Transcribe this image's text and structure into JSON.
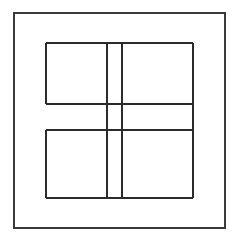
{
  "image": {
    "width": 238,
    "height": 242,
    "background_color": "#ffffff",
    "kind": "line-drawing",
    "title": "",
    "text_labels": []
  },
  "style": {
    "line_color": "#3a3a3a",
    "line_color_dark": "#2b2b2b",
    "outer_frame_width": 1.6,
    "inner_line_width": 1.5
  },
  "figure": {
    "outer_frame": {
      "name": "outer-frame",
      "x1": 14,
      "y1": 13,
      "x2": 225,
      "y2": 228
    },
    "inner_bounds": {
      "x1": 46,
      "y1": 43,
      "x2": 193,
      "y2": 198
    },
    "vertical_lines": [
      {
        "name": "inner-left-edge-upper",
        "x": 46,
        "y1": 43,
        "y2": 104
      },
      {
        "name": "inner-left-edge-lower",
        "x": 46,
        "y1": 130,
        "y2": 198
      },
      {
        "name": "inner-divider-vertical-a",
        "x": 107,
        "y1": 43,
        "y2": 198
      },
      {
        "name": "inner-divider-vertical-b",
        "x": 122,
        "y1": 43,
        "y2": 198
      },
      {
        "name": "inner-right-edge",
        "x": 193,
        "y1": 43,
        "y2": 198
      }
    ],
    "horizontal_lines": [
      {
        "name": "inner-top-edge",
        "y": 43,
        "x1": 46,
        "x2": 193
      },
      {
        "name": "inner-divider-horizontal-upper",
        "y": 104,
        "x1": 46,
        "x2": 193
      },
      {
        "name": "inner-divider-horizontal-lower",
        "y": 130,
        "x1": 46,
        "x2": 193
      },
      {
        "name": "inner-bottom-edge",
        "y": 198,
        "x1": 46,
        "x2": 193
      }
    ],
    "panes": [
      {
        "name": "pane-top-left",
        "x1": 46,
        "y1": 43,
        "x2": 107,
        "y2": 104
      },
      {
        "name": "pane-top-middle",
        "x1": 107,
        "y1": 43,
        "x2": 122,
        "y2": 104
      },
      {
        "name": "pane-top-right",
        "x1": 122,
        "y1": 43,
        "x2": 193,
        "y2": 104
      },
      {
        "name": "pane-middle-left",
        "x1": 46,
        "y1": 104,
        "x2": 107,
        "y2": 130
      },
      {
        "name": "pane-middle-center",
        "x1": 107,
        "y1": 104,
        "x2": 122,
        "y2": 130
      },
      {
        "name": "pane-middle-right",
        "x1": 122,
        "y1": 104,
        "x2": 193,
        "y2": 130
      },
      {
        "name": "pane-bottom-left",
        "x1": 46,
        "y1": 130,
        "x2": 107,
        "y2": 198
      },
      {
        "name": "pane-bottom-middle",
        "x1": 107,
        "y1": 130,
        "x2": 122,
        "y2": 198
      },
      {
        "name": "pane-bottom-right",
        "x1": 122,
        "y1": 130,
        "x2": 193,
        "y2": 198
      }
    ]
  }
}
